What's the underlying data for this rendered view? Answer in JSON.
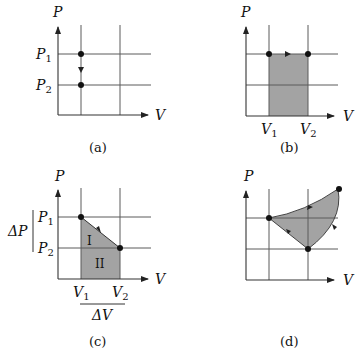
{
  "panels": {
    "a": {
      "caption": "(a)",
      "axis_y_label": "P",
      "axis_x_label": "V",
      "y_ticks": [
        {
          "label": "P",
          "sub": "1"
        },
        {
          "label": "P",
          "sub": "2"
        }
      ],
      "description": "Isochoric process: pressure drops from P1 to P2 at constant volume"
    },
    "b": {
      "caption": "(b)",
      "axis_y_label": "P",
      "axis_x_label": "V",
      "x_ticks": [
        {
          "label": "V",
          "sub": "1"
        },
        {
          "label": "V",
          "sub": "2"
        }
      ],
      "description": "Isobaric process: volume expands from V1 to V2 at constant pressure; shaded rectangle is work"
    },
    "c": {
      "caption": "(c)",
      "axis_y_label": "P",
      "axis_x_label": "V",
      "y_ticks": [
        {
          "label": "P",
          "sub": "1"
        },
        {
          "label": "P",
          "sub": "2"
        }
      ],
      "x_ticks": [
        {
          "label": "V",
          "sub": "1"
        },
        {
          "label": "V",
          "sub": "2"
        }
      ],
      "delta_p_label": "ΔP",
      "delta_v_label": "ΔV",
      "region_labels": [
        "I",
        "II"
      ],
      "description": "Linear process from (V1,P1) to (V2,P2); area split into triangle I and rectangle II"
    },
    "d": {
      "caption": "(d)",
      "axis_y_label": "P",
      "axis_x_label": "V",
      "description": "Closed cyclic process; shaded enclosed area is net work"
    }
  },
  "colors": {
    "shade": "#a3a3a3",
    "grid": "#5a5a5a",
    "dot": "#111111",
    "background": "#ffffff"
  }
}
